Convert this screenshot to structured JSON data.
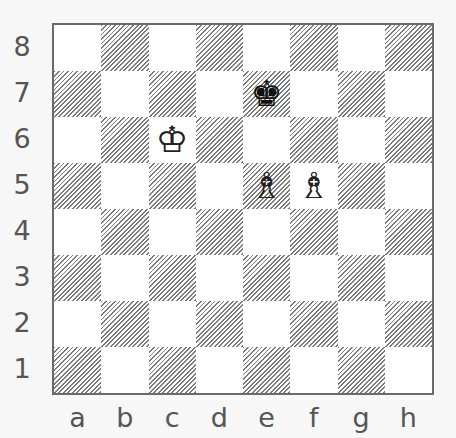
{
  "diagram": {
    "type": "chess-position",
    "ranks": [
      "8",
      "7",
      "6",
      "5",
      "4",
      "3",
      "2",
      "1"
    ],
    "files": [
      "a",
      "b",
      "c",
      "d",
      "e",
      "f",
      "g",
      "h"
    ],
    "colors": {
      "dark_square_hatch": "#7a7a7a",
      "light_square": "#ffffff",
      "border": "#6a6a6a",
      "label": "#555555"
    },
    "pieces": [
      {
        "square": "e7",
        "piece": "king",
        "color": "black",
        "glyph": "♚"
      },
      {
        "square": "c6",
        "piece": "king",
        "color": "white",
        "glyph": "♔"
      },
      {
        "square": "e5",
        "piece": "bishop",
        "color": "white",
        "glyph": "♗"
      },
      {
        "square": "f5",
        "piece": "bishop",
        "color": "white",
        "glyph": "♗"
      }
    ]
  }
}
